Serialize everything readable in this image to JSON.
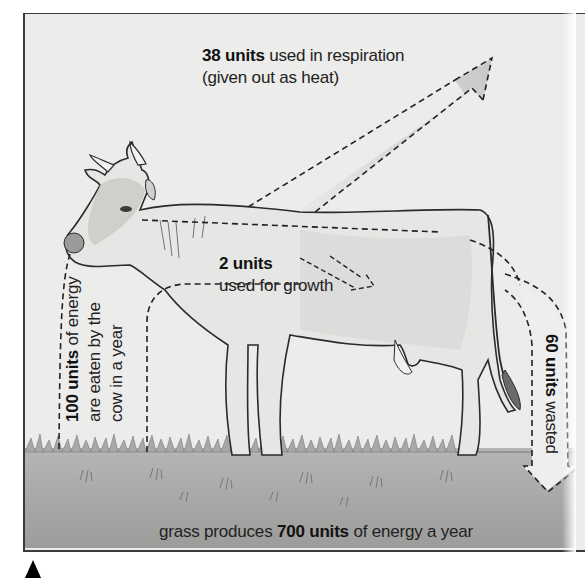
{
  "diagram": {
    "title_visible": false,
    "labels": {
      "respiration": {
        "bold": "38 units",
        "rest_line1": " used in respiration",
        "line2": "(given out as heat)"
      },
      "growth": {
        "bold": "2 units",
        "line2": "used for growth"
      },
      "eaten": {
        "bold": "100 units",
        "rest_line1": " of energy",
        "line2": "are eaten by the",
        "line3": "cow in a year"
      },
      "waste": {
        "bold": "60 units",
        "rest": " wasted"
      },
      "grass": {
        "pre": "grass produces ",
        "bold": "700 units",
        "post": " of energy a year"
      }
    },
    "flows": [
      {
        "name": "grass-production",
        "units": 700
      },
      {
        "name": "eaten-by-cow",
        "units": 100
      },
      {
        "name": "respiration-heat",
        "units": 38
      },
      {
        "name": "growth",
        "units": 2
      },
      {
        "name": "waste",
        "units": 60
      }
    ],
    "colors": {
      "background": "#ececea",
      "grass": "#9a9a98",
      "arrow_fill": "#d4d4d2",
      "outline": "#222222",
      "text": "#222222"
    }
  }
}
